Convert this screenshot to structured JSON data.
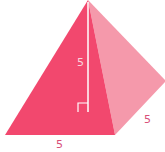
{
  "diagram": {
    "shape": "square pyramid",
    "labels": {
      "height": "5",
      "base_front": "5",
      "base_side": "5"
    },
    "colors": {
      "front_face": "#f2486e",
      "side_face": "#f599ab",
      "height_line": "#ffffff",
      "label_on_face": "#fbd3dc",
      "label_outside": "#d9507a"
    },
    "right_angle_marker": true
  }
}
